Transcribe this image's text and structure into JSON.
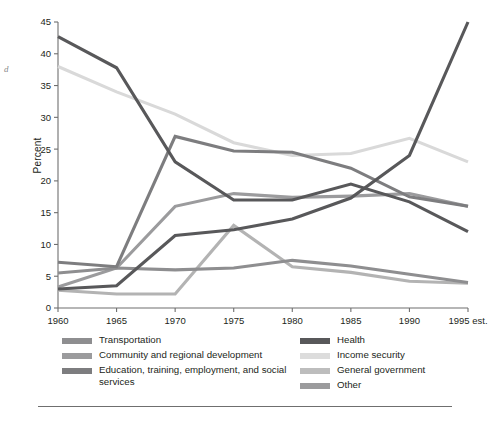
{
  "page": {
    "margin_note": "d",
    "rule": "horizontal-rule"
  },
  "chart_data": {
    "type": "line",
    "title": "",
    "xlabel": "",
    "ylabel": "Percent",
    "ylim": [
      0,
      45
    ],
    "yticks": [
      0,
      5,
      10,
      15,
      20,
      25,
      30,
      35,
      40,
      45
    ],
    "grid": false,
    "legend_position": "bottom",
    "x": [
      "1960",
      "1965",
      "1970",
      "1975",
      "1980",
      "1985",
      "1990",
      "1995 est."
    ],
    "categories": [
      "1960",
      "1965",
      "1970",
      "1975",
      "1980",
      "1985",
      "1990",
      "1995 est."
    ],
    "series": [
      {
        "name": "National defense",
        "color": "#58585a",
        "values": [
          42.7,
          37.8,
          23.0,
          17.0,
          17.0,
          19.5,
          16.7,
          12.0
        ]
      },
      {
        "name": "Health",
        "color": "#58585a",
        "values": [
          3.0,
          3.5,
          11.4,
          12.3,
          14.0,
          17.3,
          24.0,
          45.0
        ]
      },
      {
        "name": "Income security",
        "color": "#d9d9d9",
        "values": [
          38.0,
          34.0,
          30.5,
          26.0,
          24.0,
          24.3,
          26.7,
          23.0
        ]
      },
      {
        "name": "Education, training, employment, and social services",
        "color": "#7d7d7f",
        "values": [
          7.2,
          6.5,
          27.0,
          24.7,
          24.5,
          22.0,
          17.5,
          16.0
        ]
      },
      {
        "name": "Community and regional development",
        "color": "#8e8e90",
        "values": [
          5.5,
          6.3,
          6.0,
          6.3,
          7.5,
          6.6,
          5.3,
          4.0
        ]
      },
      {
        "name": "General government",
        "color": "#b3b3b3",
        "values": [
          2.8,
          2.2,
          2.2,
          13.0,
          6.5,
          5.6,
          4.2,
          3.9
        ]
      },
      {
        "name": "Other",
        "color": "#9b9b9d",
        "values": [
          3.3,
          6.3,
          16.0,
          18.0,
          17.4,
          17.6,
          18.0,
          16.0
        ]
      }
    ]
  },
  "legend": {
    "left": [
      {
        "label": "Transportation",
        "color": "#8e8e90",
        "swatch": "legend-swatch"
      },
      {
        "label": "Community and regional development",
        "color": "#9b9b9d",
        "swatch": "legend-swatch"
      },
      {
        "label": "Education, training, employment, and social services",
        "color": "#7d7d7f",
        "swatch": "legend-swatch"
      }
    ],
    "right": [
      {
        "label": "Health",
        "color": "#58585a",
        "swatch": "legend-swatch"
      },
      {
        "label": "Income security",
        "color": "#dcdcdc",
        "swatch": "legend-swatch"
      },
      {
        "label": "General government",
        "color": "#bdbdbd",
        "swatch": "legend-swatch"
      },
      {
        "label": "Other",
        "color": "#9b9b9d",
        "swatch": "legend-swatch"
      }
    ]
  }
}
